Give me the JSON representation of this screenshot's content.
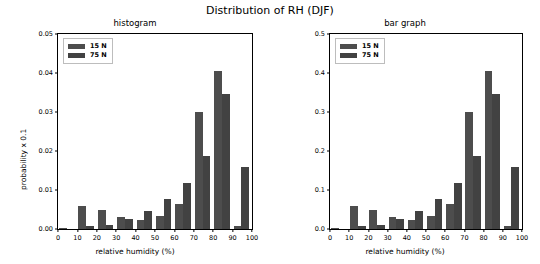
{
  "figure": {
    "title": "Distribution of RH (DJF)"
  },
  "panels": [
    {
      "key": "histogram",
      "title": "histogram",
      "xlabel": "relative humidity (%)",
      "ylabel": "probability x 0.1",
      "yticks": [
        "0.00",
        "0.01",
        "0.02",
        "0.03",
        "0.04",
        "0.05"
      ],
      "xticks": [
        "0",
        "10",
        "20",
        "30",
        "40",
        "50",
        "60",
        "70",
        "80",
        "90",
        "100"
      ],
      "legend": [
        "15 N",
        "75 N"
      ]
    },
    {
      "key": "bargraph",
      "title": "bar graph",
      "xlabel": "relative humidity (%)",
      "ylabel": "probability",
      "yticks": [
        "0.0",
        "0.1",
        "0.2",
        "0.3",
        "0.4",
        "0.5"
      ],
      "xticks": [
        "0",
        "10",
        "20",
        "30",
        "40",
        "50",
        "60",
        "70",
        "80",
        "90",
        "100"
      ],
      "legend": [
        "15 N",
        "75 N"
      ]
    }
  ],
  "chart_data": [
    {
      "type": "bar",
      "title": "histogram",
      "suptitle": "Distribution of RH (DJF)",
      "xlabel": "relative humidity (%)",
      "ylabel": "probability x 0.1",
      "xlim": [
        0,
        100
      ],
      "ylim": [
        0,
        0.05
      ],
      "grid": false,
      "legend_position": "upper left",
      "categories": [
        5,
        15,
        25,
        35,
        45,
        55,
        65,
        75,
        85,
        95
      ],
      "series": [
        {
          "name": "15 N",
          "color": "#4d4d4d",
          "values": [
            0.0002,
            0.006,
            0.005,
            0.003,
            0.0022,
            0.0034,
            0.0063,
            0.0301,
            0.0404,
            0.0008
          ]
        },
        {
          "name": "75 N",
          "color": "#424242",
          "values": [
            0.0001,
            0.0007,
            0.001,
            0.0026,
            0.0045,
            0.0078,
            0.0119,
            0.0186,
            0.0345,
            0.0159
          ]
        }
      ]
    },
    {
      "type": "bar",
      "title": "bar graph",
      "suptitle": "Distribution of RH (DJF)",
      "xlabel": "relative humidity (%)",
      "ylabel": "probability",
      "xlim": [
        0,
        100
      ],
      "ylim": [
        0,
        0.5
      ],
      "grid": false,
      "legend_position": "upper left",
      "categories": [
        5,
        15,
        25,
        35,
        45,
        55,
        65,
        75,
        85,
        95
      ],
      "series": [
        {
          "name": "15 N",
          "color": "#4d4d4d",
          "values": [
            0.002,
            0.06,
            0.05,
            0.03,
            0.022,
            0.034,
            0.063,
            0.301,
            0.404,
            0.008
          ]
        },
        {
          "name": "75 N",
          "color": "#424242",
          "values": [
            0.001,
            0.007,
            0.01,
            0.026,
            0.045,
            0.078,
            0.119,
            0.186,
            0.345,
            0.159
          ]
        }
      ]
    }
  ]
}
